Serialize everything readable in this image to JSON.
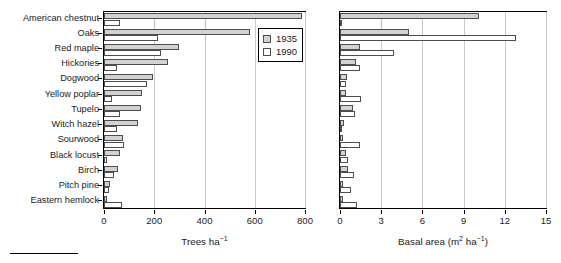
{
  "chart_data": [
    {
      "type": "bar",
      "orientation": "horizontal",
      "panel": "left",
      "title": "",
      "xlabel": "Trees ha−1",
      "ylabel": "",
      "xlim": [
        0,
        800
      ],
      "xticks": [
        0,
        200,
        400,
        600,
        800
      ],
      "xticklabels": [
        "0",
        "200",
        "400",
        "600",
        "800"
      ],
      "grid": "vertical",
      "legend": [
        "1935",
        "1990"
      ],
      "legend_position": "upper right",
      "categories": [
        "American chestnut",
        "Oaks",
        "Red maple",
        "Hickories",
        "Dogwood",
        "Yellow poplar",
        "Tupelo",
        "Witch hazel",
        "Sourwood",
        "Black locust",
        "Birch",
        "Pitch pine",
        "Eastern hemlock"
      ],
      "series": [
        {
          "name": "1935",
          "color": "#d2d2d2",
          "values": [
            790,
            580,
            300,
            255,
            195,
            150,
            148,
            135,
            75,
            65,
            57,
            22,
            12
          ]
        },
        {
          "name": "1990",
          "color": "#ffffff",
          "values": [
            63,
            213,
            225,
            50,
            172,
            30,
            65,
            52,
            78,
            10,
            38,
            18,
            70
          ]
        }
      ]
    },
    {
      "type": "bar",
      "orientation": "horizontal",
      "panel": "right",
      "title": "",
      "xlabel": "Basal area (m2 ha−1)",
      "ylabel": "",
      "xlim": [
        0,
        15
      ],
      "xticks": [
        0,
        3,
        6,
        9,
        12,
        15
      ],
      "xticklabels": [
        "0",
        "3",
        "6",
        "9",
        "12",
        "15"
      ],
      "grid": "vertical",
      "legend": [
        "1935",
        "1990"
      ],
      "categories": [
        "American chestnut",
        "Oaks",
        "Red maple",
        "Hickories",
        "Dogwood",
        "Yellow poplar",
        "Tupelo",
        "Witch hazel",
        "Sourwood",
        "Black locust",
        "Birch",
        "Pitch pine",
        "Eastern hemlock"
      ],
      "series": [
        {
          "name": "1935",
          "color": "#d2d2d2",
          "values": [
            10.1,
            5.0,
            1.45,
            1.15,
            0.5,
            0.45,
            0.95,
            0.3,
            0.2,
            0.45,
            0.6,
            0.25,
            0.25
          ]
        },
        {
          "name": "1990",
          "color": "#ffffff",
          "values": [
            0.15,
            12.8,
            3.9,
            1.45,
            0.45,
            1.55,
            1.1,
            0.15,
            1.45,
            0.55,
            1.0,
            0.8,
            1.25
          ]
        }
      ]
    }
  ],
  "axes": {
    "left": {
      "xlabel_main": "Trees ha",
      "xlabel_sup": "−1",
      "ticklabels": [
        "0",
        "200",
        "400",
        "600",
        "800"
      ]
    },
    "right": {
      "xlabel_pre": "Basal area (m",
      "xlabel_sup1": "2",
      "xlabel_mid": " ha",
      "xlabel_sup2": "−1",
      "xlabel_post": ")",
      "ticklabels": [
        "0",
        "3",
        "6",
        "9",
        "12",
        "15"
      ]
    }
  },
  "legend": {
    "items": [
      {
        "label": "1935",
        "color": "#d2d2d2"
      },
      {
        "label": "1990",
        "color": "#ffffff"
      }
    ]
  },
  "categories": [
    "American chestnut",
    "Oaks",
    "Red maple",
    "Hickories",
    "Dogwood",
    "Yellow poplar",
    "Tupelo",
    "Witch hazel",
    "Sourwood",
    "Black locust",
    "Birch",
    "Pitch pine",
    "Eastern hemlock"
  ]
}
